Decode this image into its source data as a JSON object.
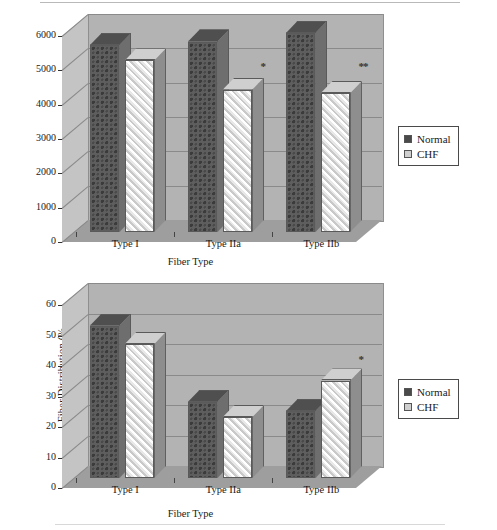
{
  "page": {
    "figure_count": 2
  },
  "legend": {
    "series": [
      {
        "label": "Normal",
        "swatch": "dark-checkered",
        "color": "#4a4a4a"
      },
      {
        "label": "CHF",
        "swatch": "light-hatched",
        "color": "#cfcfcf"
      }
    ]
  },
  "chart_data": [
    {
      "type": "bar",
      "id": "fiber-area-chart",
      "title": "",
      "xlabel": "Fiber Type",
      "ylabel": "Fiber Area (square micrometer)",
      "categories": [
        "Type I",
        "Type IIa",
        "Type IIb"
      ],
      "ylim": [
        0,
        6000
      ],
      "yticks": [
        0,
        1000,
        2000,
        3000,
        4000,
        5000,
        6000
      ],
      "ytick_labels": [
        "0",
        "1000",
        "2000",
        "3000",
        "4000",
        "5000",
        "6000"
      ],
      "grid": true,
      "legend_position": "right",
      "series": [
        {
          "name": "Normal",
          "values": [
            5450,
            5550,
            5800
          ]
        },
        {
          "name": "CHF",
          "values": [
            5000,
            4150,
            4050
          ]
        }
      ],
      "annotations": [
        {
          "text": "*",
          "category": "Type IIa",
          "value": 5000
        },
        {
          "text": "**",
          "category": "Type IIb",
          "value": 5000
        }
      ]
    },
    {
      "type": "bar",
      "id": "fiber-distribution-chart",
      "title": "",
      "xlabel": "Fiber Type",
      "ylabel": "Fiber Distribution (%",
      "categories": [
        "Type I",
        "Type IIa",
        "Type IIb"
      ],
      "ylim": [
        0,
        60
      ],
      "yticks": [
        0,
        10,
        20,
        30,
        40,
        50,
        60
      ],
      "ytick_labels": [
        "0",
        "10",
        "20",
        "30",
        "40",
        "50",
        "60"
      ],
      "grid": true,
      "legend_position": "right",
      "series": [
        {
          "name": "Normal",
          "values": [
            50,
            25,
            22
          ]
        },
        {
          "name": "CHF",
          "values": [
            44,
            20,
            32
          ]
        }
      ],
      "annotations": [
        {
          "text": "*",
          "category": "Type IIb",
          "value": 41
        }
      ]
    }
  ]
}
